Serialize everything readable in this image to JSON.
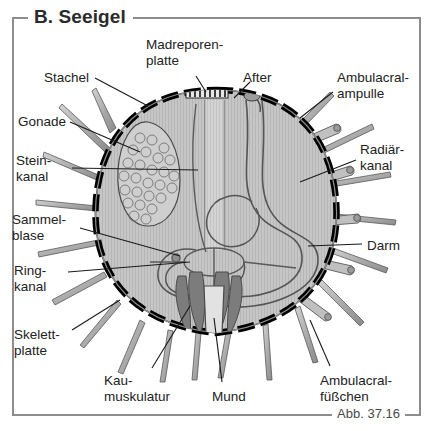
{
  "panel": {
    "title": "B. Seeigel",
    "caption": "Abb. 37.16"
  },
  "diagram": {
    "subject": "Seeigel",
    "view": "Längsschnitt",
    "colors": {
      "body_cavity": "#c9c9c9",
      "skeleton_plate": "#000000",
      "spine": "#b0b0b0",
      "gut": "#dcdcdc",
      "muscle": "#7a7a7a",
      "outline": "#4a4a4a",
      "label_text": "#222222",
      "frame": "#8d8d8d"
    }
  },
  "labels": [
    {
      "id": "stachel",
      "text": "Stachel",
      "x": 44,
      "y": 70,
      "align": "left"
    },
    {
      "id": "gonade",
      "text": "Gonade",
      "x": 18,
      "y": 114,
      "align": "left"
    },
    {
      "id": "steinkanal",
      "text": "Stein-\nkanal",
      "x": 16,
      "y": 153,
      "align": "left"
    },
    {
      "id": "sammelblase",
      "text": "Sammel-\nblase",
      "x": 12,
      "y": 212,
      "align": "left"
    },
    {
      "id": "ringkanal",
      "text": "Ring-\nkanal",
      "x": 14,
      "y": 263,
      "align": "left"
    },
    {
      "id": "skelettplatte",
      "text": "Skelett-\nplatte",
      "x": 14,
      "y": 327,
      "align": "left"
    },
    {
      "id": "madreporenplatte",
      "text": "Madreporen-\nplatte",
      "x": 146,
      "y": 37,
      "align": "left"
    },
    {
      "id": "after",
      "text": "After",
      "x": 243,
      "y": 70,
      "align": "left"
    },
    {
      "id": "ambulacralampulle",
      "text": "Ambulacral-\nampulle",
      "x": 337,
      "y": 70,
      "align": "left"
    },
    {
      "id": "radiaerkanal",
      "text": "Radiär-\nkanal",
      "x": 360,
      "y": 142,
      "align": "left"
    },
    {
      "id": "darm",
      "text": "Darm",
      "x": 367,
      "y": 238,
      "align": "left"
    },
    {
      "id": "kaumuskulatur",
      "text": "Kau-\nmuskulatur",
      "x": 104,
      "y": 373,
      "align": "left"
    },
    {
      "id": "mund",
      "text": "Mund",
      "x": 212,
      "y": 389,
      "align": "left"
    },
    {
      "id": "ambulacralfuesschen",
      "text": "Ambulacral-\nfüßchen",
      "x": 320,
      "y": 373,
      "align": "left"
    }
  ],
  "anatomy_parts": [
    {
      "id": "stachel",
      "name": "Stachel",
      "english": "spine"
    },
    {
      "id": "gonade",
      "name": "Gonade",
      "english": "gonad"
    },
    {
      "id": "steinkanal",
      "name": "Steinkanal",
      "english": "stone canal"
    },
    {
      "id": "sammelblase",
      "name": "Sammelblase",
      "english": "collecting vesicle"
    },
    {
      "id": "ringkanal",
      "name": "Ringkanal",
      "english": "ring canal"
    },
    {
      "id": "skelettplatte",
      "name": "Skelettplatte",
      "english": "skeletal plate"
    },
    {
      "id": "madreporenplatte",
      "name": "Madreporenplatte",
      "english": "madreporite"
    },
    {
      "id": "after",
      "name": "After",
      "english": "anus"
    },
    {
      "id": "ambulacralampulle",
      "name": "Ambulacralampulle",
      "english": "ampulla"
    },
    {
      "id": "radiaerkanal",
      "name": "Radiärkanal",
      "english": "radial canal"
    },
    {
      "id": "darm",
      "name": "Darm",
      "english": "gut"
    },
    {
      "id": "kaumuskulatur",
      "name": "Kaumuskulatur",
      "english": "jaw musculature"
    },
    {
      "id": "mund",
      "name": "Mund",
      "english": "mouth"
    },
    {
      "id": "ambulacralfuesschen",
      "name": "Ambulacralfüßchen",
      "english": "tube feet"
    }
  ]
}
